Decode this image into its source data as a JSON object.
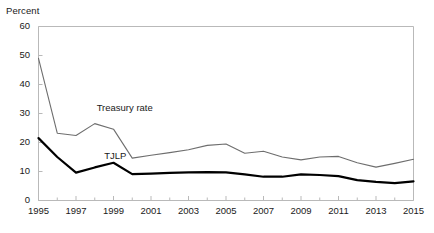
{
  "chart_data": {
    "type": "line",
    "title": "",
    "subtitle": "",
    "xlabel": "",
    "ylabel": "Percent",
    "ylim": [
      0,
      60
    ],
    "xlim": [
      1995,
      2015
    ],
    "grid": false,
    "legend_position": "inline-annotations",
    "ytick_labels": [
      "0",
      "10",
      "20",
      "30",
      "40",
      "50",
      "60"
    ],
    "ytick_values": [
      0,
      10,
      20,
      30,
      40,
      50,
      60
    ],
    "xtick_labels": [
      "1995",
      "1997",
      "1999",
      "2001",
      "2003",
      "2005",
      "2007",
      "2009",
      "2011",
      "2013",
      "2015"
    ],
    "xtick_values": [
      1995,
      1997,
      1999,
      2001,
      2003,
      2005,
      2007,
      2009,
      2011,
      2013,
      2015
    ],
    "x": [
      1995,
      1996,
      1997,
      1998,
      1999,
      2000,
      2001,
      2002,
      2003,
      2004,
      2005,
      2006,
      2007,
      2008,
      2009,
      2010,
      2011,
      2012,
      2013,
      2014,
      2015
    ],
    "series": [
      {
        "name": "Treasury rate",
        "color": "#6e6e6e",
        "width": 1.1,
        "annotation": "Treasury rate",
        "values": [
          49.0,
          23.2,
          22.4,
          26.5,
          24.6,
          14.6,
          15.6,
          16.5,
          17.5,
          19.0,
          19.5,
          16.3,
          17.0,
          15.0,
          14.0,
          15.0,
          15.2,
          13.0,
          11.5,
          12.8,
          14.2
        ]
      },
      {
        "name": "TJLP",
        "color": "#000000",
        "width": 2.2,
        "annotation": "TJLP",
        "values": [
          21.5,
          15.0,
          9.6,
          11.4,
          13.0,
          9.1,
          9.3,
          9.5,
          9.7,
          9.8,
          9.7,
          9.0,
          8.2,
          8.2,
          9.0,
          8.8,
          8.4,
          7.0,
          6.4,
          6.0,
          6.6
        ]
      }
    ],
    "annotations": [
      {
        "text": "Treasury rate",
        "x": 1998.1,
        "y": 31.5
      },
      {
        "text": "TJLP",
        "x": 1998.5,
        "y": 15.0
      }
    ]
  },
  "plot_frame": {
    "border_color": "#b9b9b9",
    "background": "#ffffff"
  }
}
